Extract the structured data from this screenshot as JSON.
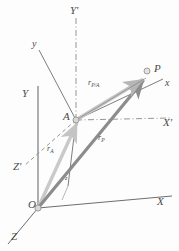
{
  "figure": {
    "colors": {
      "axis": "#6e6e6e",
      "dashed_axis": "#8a8a8a",
      "vector_rP": "#8c8c8c",
      "vector_rA": "#c9c9c9",
      "vector_rPA": "#bfbfbf",
      "label": "#4a4a4a",
      "background": "#fdfdfd"
    },
    "points": [
      {
        "id": "O",
        "label": "O",
        "x": 38,
        "y": 208,
        "role": "fixed-frame-origin"
      },
      {
        "id": "A",
        "label": "A",
        "x": 76,
        "y": 120,
        "role": "translating-frame-origin"
      },
      {
        "id": "P",
        "label": "P",
        "x": 147,
        "y": 78,
        "role": "particle"
      }
    ],
    "axes": [
      {
        "id": "X",
        "label": "X",
        "style": "solid",
        "label_x": 157,
        "label_y": 203
      },
      {
        "id": "Y",
        "label": "Y",
        "style": "solid",
        "label_x": 22,
        "label_y": 95
      },
      {
        "id": "Z",
        "label": "Z",
        "style": "solid",
        "label_x": 11,
        "label_y": 238
      },
      {
        "id": "Xp",
        "label": "X'",
        "style": "dashdot",
        "label_x": 164,
        "label_y": 124
      },
      {
        "id": "Yp",
        "label": "Y'",
        "style": "dashdot",
        "label_x": 72,
        "label_y": 8
      },
      {
        "id": "Zp",
        "label": "Z'",
        "style": "dashed",
        "label_x": 13,
        "label_y": 168
      },
      {
        "id": "x",
        "label": "x",
        "style": "solid",
        "label_x": 166,
        "label_y": 85
      },
      {
        "id": "y",
        "label": "y",
        "style": "solid",
        "label_x": 33,
        "label_y": 46
      },
      {
        "id": "z",
        "label": "z",
        "style": "solid",
        "label_x": 66,
        "label_y": 178
      }
    ],
    "vectors": [
      {
        "id": "rA",
        "label": "r",
        "subscript": "A",
        "from": "O",
        "to": "A",
        "color": "#c9c9c9",
        "label_x": 48,
        "label_y": 150
      },
      {
        "id": "rP",
        "label": "r",
        "subscript": "P",
        "from": "O",
        "to": "P",
        "color": "#8c8c8c",
        "label_x": 99,
        "label_y": 140
      },
      {
        "id": "rPA",
        "label": "r",
        "subscript": "P/A",
        "from": "A",
        "to": "P",
        "color": "#bfbfbf",
        "label_x": 90,
        "label_y": 83
      }
    ]
  }
}
